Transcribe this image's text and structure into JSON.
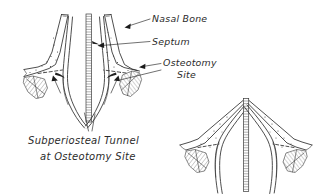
{
  "figure": {
    "background_color": "#ffffff",
    "ink_color": "#2e2e2e",
    "text_color": "#2b2b2b",
    "labels": [
      {
        "id": "nasal-bone",
        "text": "Nasal Bone",
        "x": 152,
        "y": 22
      },
      {
        "id": "septum",
        "text": "Septum",
        "x": 152,
        "y": 45
      },
      {
        "id": "osteotomy-site-line1",
        "text": "Osteotomy",
        "x": 163,
        "y": 66
      },
      {
        "id": "osteotomy-site-line2",
        "text": "Site",
        "x": 177,
        "y": 78
      }
    ],
    "caption": {
      "line1": "Subperiosteal Tunnel",
      "line2": "at Osteotomy Site",
      "x1": 28,
      "y1": 144,
      "x2": 40,
      "y2": 160
    },
    "panels": [
      {
        "id": "upper-left-panel",
        "name": "Coronal view before infracture with subperiosteal tunnel"
      },
      {
        "id": "lower-right-panel",
        "name": "Coronal view after medial infracture of nasal bones"
      }
    ],
    "annotations": [
      {
        "id": "leader-nasal-bone",
        "target": "right nasal bone segment"
      },
      {
        "id": "leader-septum",
        "target": "central septum band"
      },
      {
        "id": "leader-osteotomy-right",
        "target": "right osteotomy fracture line"
      },
      {
        "id": "leader-osteotomy-left",
        "target": "left osteotomy fracture line"
      },
      {
        "id": "arrow-tunnel-left",
        "target": "left subperiosteal tunnel"
      },
      {
        "id": "arrow-tunnel-right",
        "target": "right subperiosteal tunnel"
      }
    ]
  }
}
